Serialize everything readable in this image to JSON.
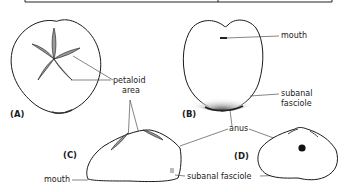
{
  "figure": {
    "top_frame": "caption-box-border",
    "panels": [
      {
        "id": "A",
        "label": "(A)",
        "view": "aboral (top) view"
      },
      {
        "id": "B",
        "label": "(B)",
        "view": "oral (bottom) view"
      },
      {
        "id": "C",
        "label": "(C)",
        "view": "lateral (side) view"
      },
      {
        "id": "D",
        "label": "(D)",
        "view": "posterior view"
      }
    ],
    "annotations": {
      "petaloid_line1": "petaloid",
      "petaloid_line2": "area",
      "mouth_b": "mouth",
      "subanal_line1": "subanal",
      "subanal_line2": "fasciole",
      "anus": "anus",
      "mouth_c": "mouth",
      "subanal_fasciole": "subanal fasciole"
    },
    "colors": {
      "ink": "#1a1a1a",
      "shade": "#9a9a9a",
      "background": "#ffffff"
    }
  }
}
